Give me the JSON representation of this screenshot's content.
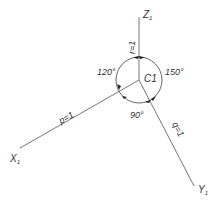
{
  "diagram": {
    "center_label": "C1",
    "axes": {
      "z": {
        "label": "Z",
        "subscript": "1",
        "ratio": "r=1"
      },
      "x": {
        "label": "X",
        "subscript": "1",
        "ratio": "p=1"
      },
      "y": {
        "label": "Y",
        "subscript": "1",
        "ratio": "q=1"
      }
    },
    "angles": {
      "zx": "120°",
      "zy": "150°",
      "xy": "90°"
    },
    "colors": {
      "line": "#555555",
      "text": "#333333"
    }
  }
}
